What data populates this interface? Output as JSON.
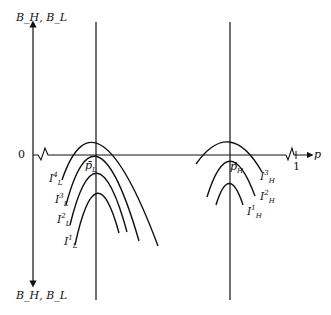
{
  "diagram": {
    "y_axis_label_top": "B_H, B_L",
    "y_axis_label_bottom": "B_H, B_L",
    "x_axis_label": "p",
    "origin_label": "0",
    "x_tick_label": "1",
    "vertical_lines": [
      {
        "id": "pL",
        "label_main": "p̄",
        "label_sub": "L"
      },
      {
        "id": "pH",
        "label_main": "p̄",
        "label_sub": "H"
      }
    ],
    "left_curves": [
      {
        "label_main": "I",
        "label_sup": "4",
        "label_sub": "L"
      },
      {
        "label_main": "I",
        "label_sup": "3",
        "label_sub": "L"
      },
      {
        "label_main": "I",
        "label_sup": "2",
        "label_sub": "L"
      },
      {
        "label_main": "I",
        "label_sup": "1",
        "label_sub": "L"
      }
    ],
    "right_curves": [
      {
        "label_main": "I",
        "label_sup": "3",
        "label_sub": "H"
      },
      {
        "label_main": "I",
        "label_sup": "2",
        "label_sub": "H"
      },
      {
        "label_main": "I",
        "label_sup": "1",
        "label_sub": "H"
      }
    ],
    "colors": {
      "ink": "#111111",
      "background": "#ffffff"
    }
  }
}
